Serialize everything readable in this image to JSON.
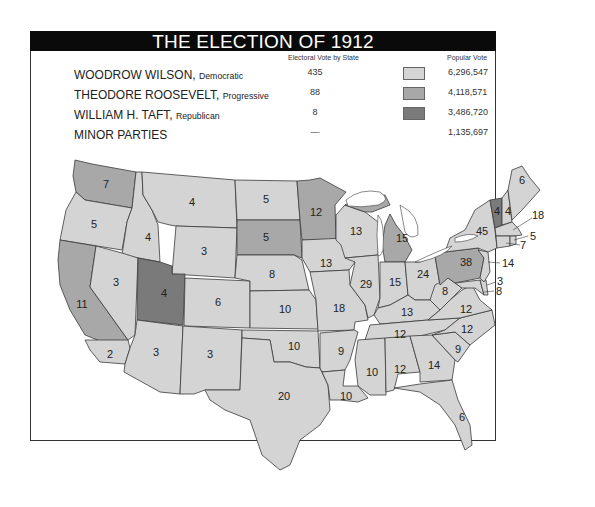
{
  "title": "THE ELECTION OF 1912",
  "legend": {
    "ev_header": "Electoral Vote by State",
    "pv_header": "Popular Vote",
    "rows": [
      {
        "name": "WOODROW WILSON,",
        "party": "Democratic",
        "ev": "435",
        "pv": "6,296,547",
        "color": "#d4d4d4"
      },
      {
        "name": "THEODORE ROOSEVELT,",
        "party": "Progressive",
        "ev": "88",
        "pv": "4,118,571",
        "color": "#a8a8a8"
      },
      {
        "name": "WILLIAM H. TAFT,",
        "party": "Republican",
        "ev": "8",
        "pv": "3,486,720",
        "color": "#7a7a7a"
      },
      {
        "name": "MINOR PARTIES",
        "party": "",
        "ev": "—",
        "pv": "1,135,697",
        "color": ""
      }
    ]
  },
  "colors": {
    "wilson": "#d4d4d4",
    "roosevelt": "#a8a8a8",
    "taft": "#7a7a7a",
    "water": "#ffffff",
    "border": "#3a3a3a"
  },
  "states": [
    {
      "id": "WA",
      "ev": "7",
      "winner": "roosevelt"
    },
    {
      "id": "OR",
      "ev": "5",
      "winner": "wilson"
    },
    {
      "id": "CA",
      "ev": "11",
      "winner": "roosevelt",
      "split": "CA 11 Roosevelt, 2 Wilson"
    },
    {
      "id": "CA-south",
      "ev": "2",
      "winner": "wilson"
    },
    {
      "id": "ID",
      "ev": "4",
      "winner": "wilson"
    },
    {
      "id": "NV",
      "ev": "3",
      "winner": "wilson"
    },
    {
      "id": "MT",
      "ev": "4",
      "winner": "wilson"
    },
    {
      "id": "WY",
      "ev": "3",
      "winner": "wilson"
    },
    {
      "id": "UT",
      "ev": "4",
      "winner": "taft"
    },
    {
      "id": "CO",
      "ev": "6",
      "winner": "wilson"
    },
    {
      "id": "AZ",
      "ev": "3",
      "winner": "wilson"
    },
    {
      "id": "NM",
      "ev": "3",
      "winner": "wilson"
    },
    {
      "id": "ND",
      "ev": "5",
      "winner": "wilson"
    },
    {
      "id": "SD",
      "ev": "5",
      "winner": "roosevelt"
    },
    {
      "id": "NE",
      "ev": "8",
      "winner": "wilson"
    },
    {
      "id": "KS",
      "ev": "10",
      "winner": "wilson"
    },
    {
      "id": "OK",
      "ev": "10",
      "winner": "wilson"
    },
    {
      "id": "TX",
      "ev": "20",
      "winner": "wilson"
    },
    {
      "id": "MN",
      "ev": "12",
      "winner": "roosevelt"
    },
    {
      "id": "IA",
      "ev": "13",
      "winner": "wilson"
    },
    {
      "id": "MO",
      "ev": "18",
      "winner": "wilson"
    },
    {
      "id": "AR",
      "ev": "9",
      "winner": "wilson"
    },
    {
      "id": "LA",
      "ev": "10",
      "winner": "wilson"
    },
    {
      "id": "WI",
      "ev": "13",
      "winner": "wilson"
    },
    {
      "id": "IL",
      "ev": "29",
      "winner": "wilson"
    },
    {
      "id": "MI",
      "ev": "15",
      "winner": "roosevelt"
    },
    {
      "id": "IN",
      "ev": "15",
      "winner": "wilson"
    },
    {
      "id": "OH",
      "ev": "24",
      "winner": "wilson"
    },
    {
      "id": "KY",
      "ev": "13",
      "winner": "wilson"
    },
    {
      "id": "TN",
      "ev": "12",
      "winner": "wilson"
    },
    {
      "id": "MS",
      "ev": "10",
      "winner": "wilson"
    },
    {
      "id": "AL",
      "ev": "12",
      "winner": "wilson"
    },
    {
      "id": "GA",
      "ev": "14",
      "winner": "wilson"
    },
    {
      "id": "FL",
      "ev": "6",
      "winner": "wilson"
    },
    {
      "id": "SC",
      "ev": "9",
      "winner": "wilson"
    },
    {
      "id": "NC",
      "ev": "12",
      "winner": "wilson"
    },
    {
      "id": "VA",
      "ev": "12",
      "winner": "wilson"
    },
    {
      "id": "WV",
      "ev": "8",
      "winner": "wilson"
    },
    {
      "id": "PA",
      "ev": "38",
      "winner": "roosevelt"
    },
    {
      "id": "NY",
      "ev": "45",
      "winner": "wilson"
    },
    {
      "id": "VT",
      "ev": "4",
      "winner": "taft"
    },
    {
      "id": "NH",
      "ev": "4",
      "winner": "wilson"
    },
    {
      "id": "ME",
      "ev": "6",
      "winner": "wilson"
    },
    {
      "id": "MA",
      "ev": "18",
      "winner": "wilson"
    },
    {
      "id": "RI",
      "ev": "5",
      "winner": "wilson"
    },
    {
      "id": "CT",
      "ev": "7",
      "winner": "wilson"
    },
    {
      "id": "NJ",
      "ev": "14",
      "winner": "wilson"
    },
    {
      "id": "DE",
      "ev": "3",
      "winner": "wilson"
    },
    {
      "id": "MD",
      "ev": "8",
      "winner": "wilson"
    }
  ]
}
